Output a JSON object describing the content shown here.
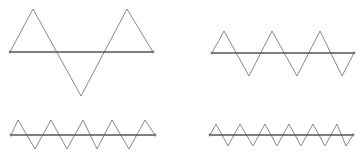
{
  "diagram": {
    "title": "",
    "colors": {
      "background": "#ffffff",
      "baseline": "#555555",
      "wave": "#8a8a8a",
      "endpoint": "#777777"
    },
    "panels": [
      {
        "id": "panel-top-left",
        "periods": 1.5,
        "baseline": {
          "x1": 10,
          "y1": 52,
          "x2": 153,
          "y2": 52
        },
        "wave_points": [
          [
            10,
            52
          ],
          [
            33,
            9
          ],
          [
            81,
            96
          ],
          [
            127,
            9
          ],
          [
            153,
            52
          ]
        ]
      },
      {
        "id": "panel-top-right",
        "periods": 3,
        "baseline": {
          "x1": 212,
          "y1": 53,
          "x2": 354,
          "y2": 53
        },
        "wave_points": [
          [
            212,
            53
          ],
          [
            224,
            31
          ],
          [
            249,
            76
          ],
          [
            272,
            31
          ],
          [
            297,
            76
          ],
          [
            320,
            31
          ],
          [
            342,
            76
          ],
          [
            354,
            53
          ]
        ]
      },
      {
        "id": "panel-bottom-left",
        "periods": 4.5,
        "baseline": {
          "x1": 11,
          "y1": 135,
          "x2": 155,
          "y2": 135
        },
        "wave_points": [
          [
            11,
            135
          ],
          [
            18,
            120
          ],
          [
            35,
            149
          ],
          [
            51,
            120
          ],
          [
            67,
            149
          ],
          [
            83,
            120
          ],
          [
            97,
            149
          ],
          [
            112,
            120
          ],
          [
            129,
            149
          ],
          [
            145,
            120
          ],
          [
            155,
            135
          ]
        ]
      },
      {
        "id": "panel-bottom-right",
        "periods": 6,
        "baseline": {
          "x1": 210,
          "y1": 135,
          "x2": 353,
          "y2": 135
        },
        "wave_points": [
          [
            210,
            135
          ],
          [
            216,
            124
          ],
          [
            228,
            146
          ],
          [
            240,
            124
          ],
          [
            253,
            146
          ],
          [
            265,
            124
          ],
          [
            277,
            146
          ],
          [
            289,
            124
          ],
          [
            301,
            146
          ],
          [
            313,
            124
          ],
          [
            325,
            146
          ],
          [
            337,
            124
          ],
          [
            346,
            146
          ],
          [
            353,
            135
          ]
        ]
      }
    ]
  }
}
